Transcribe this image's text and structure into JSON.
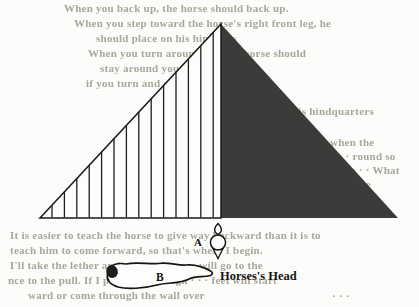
{
  "canvas": {
    "width": 419,
    "height": 307,
    "background": "#fcfcfa"
  },
  "diagram": {
    "label_a": "A",
    "label_b": "B",
    "caption": "Horses's Head",
    "triangle": {
      "left_half_style": "vertical-hatch",
      "right_half_style": "solid-dark",
      "paper_fill": "#fdfdfb",
      "solid_color": "#3b3b39",
      "outline_color": "#1a1a19",
      "hatch_color": "#1d1d1c",
      "hatch_spacing": 12.4,
      "vertices": {
        "left": [
          40,
          218
        ],
        "apex": [
          221,
          24
        ],
        "right": [
          398,
          218
        ]
      }
    },
    "marker_a_shape": "spindle-marker-top-view",
    "marker_b_shape": "horse-body-top-view",
    "marker_b_spot_color": "#1c1c1b"
  },
  "ghost_text": {
    "color": "#a5a295",
    "lines": [
      {
        "x": 64,
        "y": 2,
        "text": "When you back up, the horse should back up."
      },
      {
        "x": 74,
        "y": 17,
        "text": "When you step toward the horse's right front leg, he"
      },
      {
        "x": 96,
        "y": 32,
        "text": "should place on his hind legs"
      },
      {
        "x": 88,
        "y": 47,
        "text": "When you turn around · · · the horse should"
      },
      {
        "x": 100,
        "y": 62,
        "text": "stay around you · · ·"
      },
      {
        "x": 86,
        "y": 77,
        "text": "if you turn and · · · · him to come"
      },
      {
        "x": 292,
        "y": 105,
        "text": "his hindquarters"
      },
      {
        "x": 330,
        "y": 136,
        "text": "when the"
      },
      {
        "x": 326,
        "y": 150,
        "text": "of · · round so"
      },
      {
        "x": 322,
        "y": 164,
        "text": "ing the · · What"
      },
      {
        "x": 350,
        "y": 178,
        "text": "d be"
      },
      {
        "x": 10,
        "y": 229,
        "text": "It is easier to teach the horse to give way backward than it is to"
      },
      {
        "x": 10,
        "y": 244,
        "text": "teach him to come forward, so that's where I begin."
      },
      {
        "x": 10,
        "y": 259,
        "text": "I'll take the lether and step on it · · · · will go to the"
      },
      {
        "x": 8,
        "y": 274,
        "text": "nce to the pull. If I pull hard enough · · · feet will start"
      },
      {
        "x": 28,
        "y": 289,
        "text": "ward or come through the wall over"
      },
      {
        "x": 332,
        "y": 290,
        "text": "· · ·"
      }
    ]
  }
}
